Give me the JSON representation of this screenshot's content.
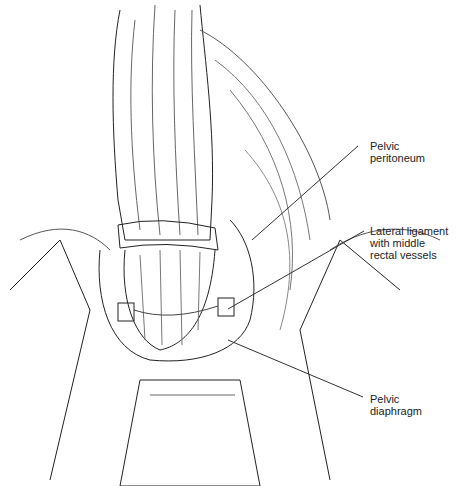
{
  "figure": {
    "labels": [
      {
        "id": "pelvic-peritoneum",
        "text": "Pelvic\nperitoneum"
      },
      {
        "id": "lateral-ligament",
        "text": "Lateral ligament\nwith middle\nrectal vessels"
      },
      {
        "id": "pelvic-diaphragm",
        "text": "Pelvic\ndiaphragm"
      }
    ]
  }
}
